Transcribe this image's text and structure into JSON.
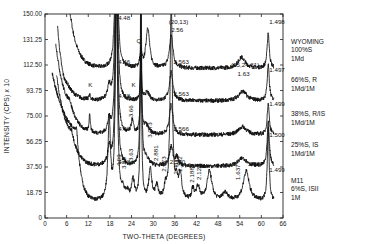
{
  "chart_data": {
    "type": "line",
    "title": "",
    "xlabel": "TWO-THETA (DEGREES)",
    "ylabel": "INTENSITY (CPS) x 10",
    "xlim": [
      0,
      66
    ],
    "ylim": [
      0,
      150
    ],
    "x_ticks": [
      "0",
      "6",
      "12",
      "18",
      "24",
      "30",
      "36",
      "42",
      "48",
      "54",
      "60",
      "66"
    ],
    "y_ticks": [
      "0",
      "18.75",
      "37.50",
      "56.25",
      "75.00",
      "93.75",
      "112.50",
      "131.25",
      "150.00"
    ],
    "grid": false,
    "legend": "right-side labels per trace",
    "series": [
      {
        "name": "WYOMING 100%S 1Md",
        "label_lines": [
          "WYOMING",
          "100%S",
          "1Md"
        ],
        "baseline": 110,
        "low_angle": {
          "start_x": 5.0,
          "peak_x": 7.0,
          "peak_y": 150,
          "decay": 2.0
        },
        "peaks": [
          [
            19.8,
            150,
            0.35
          ],
          [
            26.6,
            12,
            0.3
          ],
          [
            28.5,
            30,
            0.6
          ],
          [
            35.0,
            24,
            0.6
          ],
          [
            54.5,
            8,
            1.2
          ],
          [
            61.9,
            26,
            0.35
          ]
        ]
      },
      {
        "name": "66%S, R 1Md/1M",
        "label_lines": [
          "66%S,  R",
          "1Md/1M"
        ],
        "baseline": 86,
        "low_angle": {
          "start_x": 3.5,
          "peak_x": 6.0,
          "peak_y": 100,
          "decay": 2.2
        },
        "peaks": [
          [
            12.4,
            3,
            0.3
          ],
          [
            17.8,
            10,
            0.5
          ],
          [
            19.8,
            150,
            0.35
          ],
          [
            26.6,
            30,
            0.2
          ],
          [
            28.3,
            6,
            0.8
          ],
          [
            35.0,
            21,
            0.6
          ],
          [
            54.8,
            7,
            1.4
          ],
          [
            61.9,
            26,
            0.35
          ]
        ]
      },
      {
        "name": "38%S, R/IS 1Md/1M",
        "label_lines": [
          "38%S,  R/IS",
          "1Md/1M"
        ],
        "baseline": 61,
        "low_angle": {
          "start_x": 3.0,
          "peak_x": 6.8,
          "peak_y": 88,
          "decay": 2.2
        },
        "peaks": [
          [
            12.4,
            14,
            0.2
          ],
          [
            17.8,
            10,
            0.5
          ],
          [
            19.8,
            150,
            0.35
          ],
          [
            24.2,
            10,
            0.4
          ],
          [
            26.6,
            60,
            0.2
          ],
          [
            28.0,
            7,
            0.9
          ],
          [
            35.0,
            22,
            0.6
          ],
          [
            54.8,
            6,
            1.4
          ],
          [
            61.9,
            23,
            0.35
          ]
        ]
      },
      {
        "name": "25%S, IS 1Md/1M",
        "label_lines": [
          "25%S,  IS",
          "1Md/1M"
        ],
        "baseline": 38,
        "low_angle": {
          "start_x": 3.2,
          "peak_x": 7.4,
          "peak_y": 65,
          "decay": 1.8
        },
        "peaks": [
          [
            17.8,
            13,
            0.5
          ],
          [
            19.8,
            150,
            0.35
          ],
          [
            26.6,
            150,
            0.2
          ],
          [
            28.0,
            6,
            0.9
          ],
          [
            35.0,
            14,
            0.6
          ],
          [
            36.6,
            6,
            0.5
          ],
          [
            54.8,
            6,
            1.4
          ],
          [
            61.9,
            32,
            0.35
          ]
        ]
      },
      {
        "name": "M11 6%S, ISII 1M",
        "label_lines": [
          "M11",
          "6%S,  ISII",
          "1M"
        ],
        "baseline": 12,
        "low_angle": {
          "start_x": 2.0,
          "peak_x": 8.8,
          "peak_y": 66,
          "decay": 1.2
        },
        "peaks": [
          [
            17.8,
            60,
            0.4
          ],
          [
            19.8,
            150,
            0.35
          ],
          [
            21.6,
            7,
            0.5
          ],
          [
            22.8,
            5,
            0.5
          ],
          [
            24.4,
            15,
            0.5
          ],
          [
            26.6,
            150,
            0.2
          ],
          [
            29.2,
            22,
            0.5
          ],
          [
            31.0,
            10,
            0.5
          ],
          [
            33.4,
            9,
            0.4
          ],
          [
            35.0,
            150,
            0.35
          ],
          [
            36.5,
            12,
            0.4
          ],
          [
            37.5,
            18,
            0.5
          ],
          [
            41.0,
            8,
            0.4
          ],
          [
            42.4,
            10,
            0.6
          ],
          [
            45.6,
            22,
            0.8
          ],
          [
            50.0,
            6,
            0.9
          ],
          [
            55.8,
            22,
            1.0
          ],
          [
            61.9,
            54,
            0.3
          ]
        ]
      }
    ],
    "annotations": [
      {
        "text": "4.48",
        "x": 20.3,
        "y": 145.5
      },
      {
        "text": "4.46",
        "x": 20.3,
        "y": 113
      },
      {
        "text": "4.48",
        "x": 20.3,
        "y": 88.5
      },
      {
        "text": "4.48",
        "x": 20.3,
        "y": 64
      },
      {
        "text": "4.48",
        "x": 20.3,
        "y": 40
      },
      {
        "text": "(20,13)",
        "x": 34.3,
        "y": 143
      },
      {
        "text": "2.56",
        "x": 35.0,
        "y": 136.5
      },
      {
        "text": "2.563",
        "x": 35.6,
        "y": 113
      },
      {
        "text": "2.563",
        "x": 35.6,
        "y": 89.5
      },
      {
        "text": "2.566",
        "x": 35.6,
        "y": 64
      },
      {
        "text": "2.560",
        "x": 34.6,
        "y": 40
      },
      {
        "text": "(15,24,31)",
        "x": 51.6,
        "y": 111
      },
      {
        "text": "1.63",
        "x": 53.4,
        "y": 104.5
      },
      {
        "text": "1.498",
        "x": 62.2,
        "y": 143
      },
      {
        "text": "1.497",
        "x": 62.2,
        "y": 107
      },
      {
        "text": "1.499",
        "x": 62.2,
        "y": 82.5
      },
      {
        "text": "1.500",
        "x": 62.2,
        "y": 59.5
      },
      {
        "text": "1.499",
        "x": 62.2,
        "y": 34
      },
      {
        "text": "1.58",
        "x": 56.2,
        "y": 38
      },
      {
        "text": "Q",
        "x": 25.4,
        "y": 129
      },
      {
        "text": "K",
        "x": 12.0,
        "y": 96
      },
      {
        "text": "K",
        "x": 24.0,
        "y": 96
      }
    ],
    "rotated_annotations": [
      {
        "text": "3.66",
        "x": 24.3,
        "y": 74
      },
      {
        "text": "3.073",
        "x": 29.7,
        "y": 59
      },
      {
        "text": "4.09",
        "x": 21.2,
        "y": 38
      },
      {
        "text": "3.85",
        "x": 22.4,
        "y": 36
      },
      {
        "text": "3.63",
        "x": 24.4,
        "y": 42
      },
      {
        "text": "2.881",
        "x": 31.4,
        "y": 42
      },
      {
        "text": "2.673",
        "x": 33.6,
        "y": 34
      },
      {
        "text": "2.461",
        "x": 36.8,
        "y": 32
      },
      {
        "text": "2.382",
        "x": 38.0,
        "y": 34
      },
      {
        "text": "2.188",
        "x": 41.2,
        "y": 26
      },
      {
        "text": "2.128",
        "x": 43.2,
        "y": 28
      },
      {
        "text": "1.637",
        "x": 54.0,
        "y": 28
      }
    ]
  }
}
